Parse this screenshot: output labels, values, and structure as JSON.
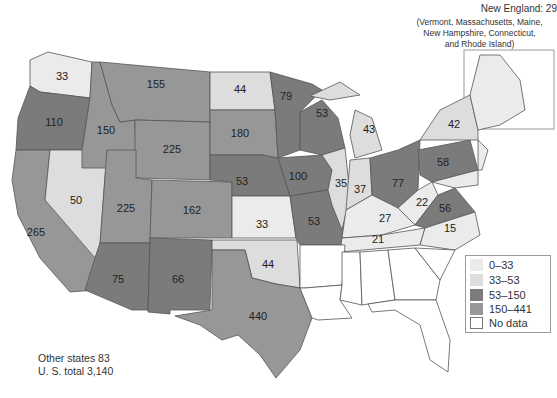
{
  "new_england": {
    "title": "New England: 29",
    "subtitle_lines": [
      "(Vermont, Massachusetts, Maine,",
      "New Hampshire, Connecticut,",
      "and Rhode Island)"
    ]
  },
  "legend": {
    "items": [
      {
        "label": "0–33",
        "color": "#ebebeb"
      },
      {
        "label": "33–53",
        "color": "#dddddd"
      },
      {
        "label": "53–150",
        "color": "#7b7b7b"
      },
      {
        "label": "150–441",
        "color": "#979797"
      },
      {
        "label": "No data",
        "color": "#ffffff"
      }
    ]
  },
  "totals": {
    "other_states": "Other states  83",
    "us_total": "U. S. total 3,140"
  },
  "states": [
    {
      "name": "Washington",
      "value": "33",
      "class": 0
    },
    {
      "name": "Oregon",
      "value": "110",
      "class": 2
    },
    {
      "name": "California",
      "value": "265",
      "class": 3
    },
    {
      "name": "Nevada",
      "value": "50",
      "class": 1
    },
    {
      "name": "Idaho",
      "value": "150",
      "class": 3
    },
    {
      "name": "Montana",
      "value": "155",
      "class": 3
    },
    {
      "name": "Wyoming",
      "value": "225",
      "class": 3
    },
    {
      "name": "Utah",
      "value": "225",
      "class": 3
    },
    {
      "name": "Arizona",
      "value": "75",
      "class": 2
    },
    {
      "name": "Colorado",
      "value": "162",
      "class": 3
    },
    {
      "name": "New Mexico",
      "value": "66",
      "class": 2
    },
    {
      "name": "North Dakota",
      "value": "44",
      "class": 1
    },
    {
      "name": "South Dakota",
      "value": "180",
      "class": 3
    },
    {
      "name": "Nebraska",
      "value": "53",
      "class": 2
    },
    {
      "name": "Kansas",
      "value": "33",
      "class": 0
    },
    {
      "name": "Oklahoma",
      "value": "44",
      "class": 1
    },
    {
      "name": "Texas",
      "value": "440",
      "class": 3
    },
    {
      "name": "Minnesota",
      "value": "79",
      "class": 2
    },
    {
      "name": "Iowa",
      "value": "100",
      "class": 2
    },
    {
      "name": "Missouri",
      "value": "53",
      "class": 2
    },
    {
      "name": "Wisconsin",
      "value": "53",
      "class": 2
    },
    {
      "name": "Illinois",
      "value": "35",
      "class": 1
    },
    {
      "name": "Michigan",
      "value": "43",
      "class": 1
    },
    {
      "name": "Indiana",
      "value": "37",
      "class": 1
    },
    {
      "name": "Ohio",
      "value": "77",
      "class": 2
    },
    {
      "name": "Kentucky",
      "value": "27",
      "class": 0
    },
    {
      "name": "Tennessee",
      "value": "21",
      "class": 0
    },
    {
      "name": "West Virginia",
      "value": "22",
      "class": 0
    },
    {
      "name": "Virginia",
      "value": "56",
      "class": 2
    },
    {
      "name": "North Carolina",
      "value": "15",
      "class": 0
    },
    {
      "name": "Pennsylvania",
      "value": "58",
      "class": 2
    },
    {
      "name": "New York",
      "value": "42",
      "class": 1
    },
    {
      "name": "New England",
      "value": "",
      "class": 0
    },
    {
      "name": "New Jersey",
      "value": "",
      "class": 0
    },
    {
      "name": "Maryland",
      "value": "",
      "class": 0
    },
    {
      "name": "Arkansas",
      "value": "",
      "class": 4
    },
    {
      "name": "Louisiana",
      "value": "",
      "class": 4
    },
    {
      "name": "Mississippi",
      "value": "",
      "class": 4
    },
    {
      "name": "Alabama",
      "value": "",
      "class": 4
    },
    {
      "name": "Georgia",
      "value": "",
      "class": 4
    },
    {
      "name": "South Carolina",
      "value": "",
      "class": 4
    },
    {
      "name": "Florida",
      "value": "",
      "class": 4
    }
  ]
}
